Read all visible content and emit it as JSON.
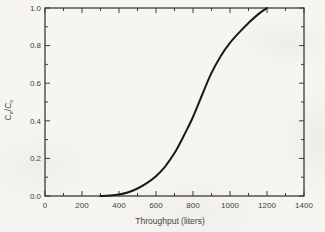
{
  "figure": {
    "background_color": "#f6f5f1",
    "axis_color": "#3c3b38",
    "text_color": "#3f3e3c",
    "curve_color": "#191918"
  },
  "chart_data": {
    "type": "line",
    "title": "",
    "xlabel": "Throughput (liters)",
    "ylabel": "Ce/Co",
    "ylabel_parts": [
      "C",
      "e",
      "/C",
      "o"
    ],
    "xlim": [
      0,
      1400
    ],
    "ylim": [
      0,
      1.0
    ],
    "grid": false,
    "legend": false,
    "x_major_ticks": [
      0,
      200,
      400,
      600,
      800,
      1000,
      1200,
      1400
    ],
    "x_tick_labels": [
      "0",
      "200",
      "400",
      "600",
      "800",
      "1000",
      "1200",
      "1400"
    ],
    "x_minor_ticks": [
      100,
      300,
      500,
      700,
      900,
      1100,
      1300
    ],
    "y_major_ticks": [
      0,
      0.2,
      0.4,
      0.6,
      0.8,
      1.0
    ],
    "y_tick_labels": [
      "0.0",
      "0.2",
      "0.4",
      "0.6",
      "0.8",
      "1.0"
    ],
    "y_minor_ticks": [
      0.1,
      0.3,
      0.5,
      0.7,
      0.9
    ],
    "series": [
      {
        "name": "breakthrough-curve",
        "x": [
          300,
          350,
          400,
          450,
          500,
          550,
          600,
          650,
          700,
          750,
          800,
          850,
          900,
          950,
          1000,
          1050,
          1100,
          1150,
          1200
        ],
        "y": [
          0.0,
          0.003,
          0.008,
          0.02,
          0.04,
          0.068,
          0.105,
          0.158,
          0.228,
          0.32,
          0.42,
          0.54,
          0.655,
          0.745,
          0.815,
          0.87,
          0.92,
          0.965,
          1.0
        ]
      }
    ]
  }
}
